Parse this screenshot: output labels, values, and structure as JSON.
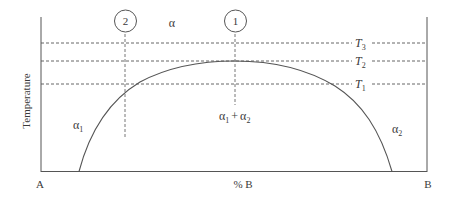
{
  "diagram": {
    "type": "binary phase diagram with miscibility gap",
    "y_axis_label": "Temperature",
    "x_axis": {
      "left_label": "A",
      "center_label": "% B",
      "right_label": "B"
    },
    "isotherms": [
      {
        "label": "T",
        "sub": "3",
        "y": 43
      },
      {
        "label": "T",
        "sub": "2",
        "y": 61
      },
      {
        "label": "T",
        "sub": "1",
        "y": 84
      }
    ],
    "compositions": [
      {
        "marker": "2",
        "x": 125,
        "line_bottom": 137
      },
      {
        "marker": "1",
        "x": 235,
        "line_bottom": 105
      }
    ],
    "regions": {
      "single_phase_top": "α",
      "alpha1": {
        "base": "α",
        "sub": "1"
      },
      "two_phase": {
        "a": "α",
        "a_sub": "1",
        "plus": "+",
        "b": "α",
        "b_sub": "2"
      },
      "alpha2": {
        "base": "α",
        "sub": "2"
      }
    },
    "colors": {
      "line": "#4a4a4a",
      "text": "#3a3a3a",
      "background": "#ffffff"
    }
  }
}
